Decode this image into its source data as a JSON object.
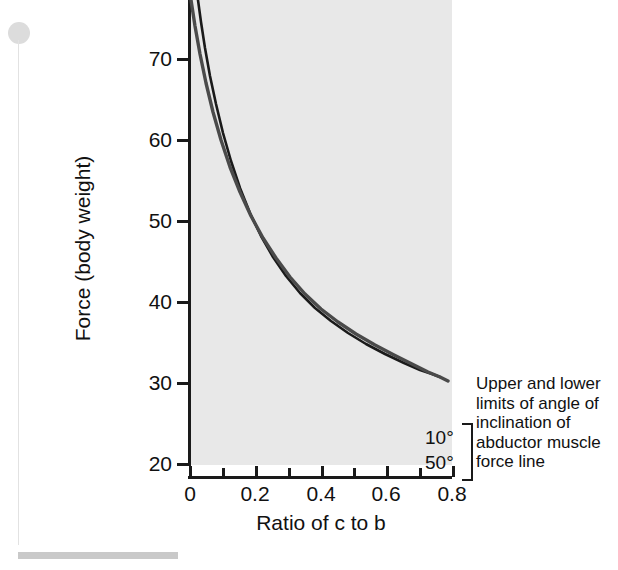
{
  "figure": {
    "name": "hip-joint-force-vs-ratio-chart"
  },
  "chart_data": {
    "type": "line",
    "title": "",
    "xlabel": "Ratio of c to b",
    "ylabel": "Force (body weight)",
    "xlim": [
      0.0,
      0.88
    ],
    "ylim": [
      17.5,
      74.5
    ],
    "xticks": [
      0,
      0.2,
      0.4,
      0.6,
      0.8
    ],
    "xticklabels": [
      "0",
      "0.2",
      "0.4",
      "0.6",
      "0.8"
    ],
    "xminorticks": [
      0.1,
      0.3,
      0.5,
      0.7
    ],
    "yticks": [
      20,
      30,
      40,
      50,
      60,
      70
    ],
    "yticklabels": [
      "20",
      "30",
      "40",
      "50",
      "60",
      "70"
    ],
    "grid": false,
    "legend_position": "right-inline-annotation",
    "annotation": "Upper and lower limits of angle of inclination of abductor muscle force line",
    "series": [
      {
        "name": "10°",
        "label": "10°",
        "color": "#1a1a1a",
        "x": [
          0.155,
          0.18,
          0.2,
          0.22,
          0.25,
          0.28,
          0.3,
          0.33,
          0.36,
          0.4,
          0.44,
          0.48,
          0.52,
          0.56,
          0.6,
          0.64,
          0.68,
          0.72,
          0.755
        ],
        "y": [
          74.5,
          66.0,
          60.6,
          55.9,
          50.3,
          46.0,
          43.6,
          40.6,
          38.1,
          35.4,
          33.3,
          31.6,
          30.2,
          29.0,
          28.0,
          27.2,
          26.4,
          25.8,
          25.3
        ]
      },
      {
        "name": "50°",
        "label": "50°",
        "color": "#4a4a4a",
        "x": [
          0.135,
          0.16,
          0.18,
          0.2,
          0.23,
          0.26,
          0.29,
          0.32,
          0.36,
          0.4,
          0.44,
          0.48,
          0.52,
          0.56,
          0.6,
          0.64,
          0.68,
          0.72,
          0.755
        ],
        "y": [
          74.5,
          65.4,
          59.5,
          54.7,
          48.9,
          44.5,
          41.1,
          38.4,
          35.5,
          33.2,
          31.4,
          29.9,
          28.6,
          27.6,
          26.7,
          25.9,
          25.2,
          24.6,
          24.2
        ]
      }
    ],
    "curve_geometry_px": {
      "note": "pixel polylines used for rendering, original image coords",
      "curve_10deg": "198,0 201,22 205,48 210,76 216,104 223,133 231,161 240,188 250,213 261,236 273,257 286,276 300,293 315,308 331,321 348,333 366,344 385,354 404,363 420,370 432,374 440,377",
      "curve_50deg": "191,0 195,26 200,54 206,83 213,112 221,140 230,167 240,192 251,216 263,238 276,258 290,277 305,294 321,309 338,322 356,334 375,345 394,355 412,364 428,372 440,377 448,381"
    }
  },
  "axes": {
    "y_label": "Force (body weight)",
    "x_label": "Ratio of c to b",
    "y_ticks": [
      {
        "value": "70",
        "pos_px": 58
      },
      {
        "value": "60",
        "pos_px": 139
      },
      {
        "value": "50",
        "pos_px": 220
      },
      {
        "value": "40",
        "pos_px": 301
      },
      {
        "value": "30",
        "pos_px": 382
      },
      {
        "value": "20",
        "pos_px": 463
      }
    ],
    "x_ticks": [
      {
        "value": "0",
        "pos_px": 189,
        "minor": false
      },
      {
        "value": "",
        "pos_px": 255,
        "minor": true
      },
      {
        "value": "0.2",
        "pos_px": 321,
        "minor": false
      },
      {
        "value": "",
        "pos_px": 386,
        "minor": true
      },
      {
        "value": "0.4",
        "pos_px": 452,
        "minor": false
      }
    ],
    "x_ticks_full": [
      {
        "value": "0",
        "pos_px": 189,
        "minor": false
      },
      {
        "value": "",
        "pos_px": 222,
        "minor": true
      },
      {
        "value": "0.2",
        "pos_px": 255,
        "minor": false
      },
      {
        "value": "",
        "pos_px": 288,
        "minor": true
      },
      {
        "value": "0.4",
        "pos_px": 321,
        "minor": false
      },
      {
        "value": "",
        "pos_px": 353,
        "minor": true
      },
      {
        "value": "0.6",
        "pos_px": 386,
        "minor": false
      },
      {
        "value": "",
        "pos_px": 419,
        "minor": true
      },
      {
        "value": "0.8",
        "pos_px": 452,
        "minor": false
      }
    ]
  },
  "curve_labels": {
    "upper": "10°",
    "lower": "50°"
  },
  "annotation": {
    "lines": [
      "Upper and lower",
      "limits of angle of",
      "inclination of",
      "abductor muscle",
      "force line"
    ],
    "full_text": "Upper and lower limits of angle of inclination of abductor muscle force line"
  },
  "colors": {
    "plot_background": "#e8e8e8",
    "axis": "#1a1a1a",
    "curve_upper": "#1a1a1a",
    "curve_lower": "#4a4a4a",
    "page_background": "#ffffff",
    "decoration": "#c9c9c9"
  }
}
